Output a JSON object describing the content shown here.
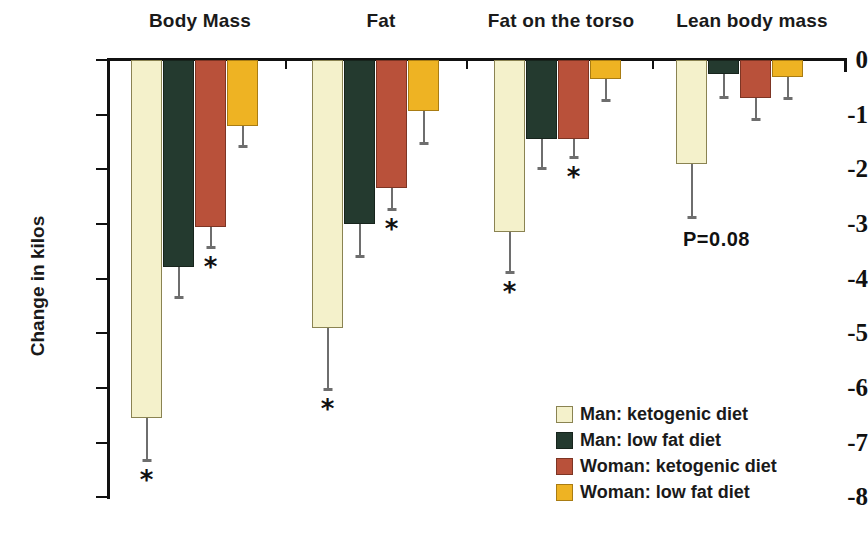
{
  "chart_data": {
    "type": "bar",
    "title": "",
    "xlabel": "",
    "ylabel": "Change in kilos",
    "ylim": [
      -8,
      0
    ],
    "grid": false,
    "legend_position": "bottom-right",
    "categories": [
      "Body Mass",
      "Fat",
      "Fat on the torso",
      "Lean body mass"
    ],
    "ytick_labels": [
      "0",
      "-1",
      "-2",
      "-3",
      "-4",
      "-5",
      "-6",
      "-7",
      "-8"
    ],
    "ytick_values": [
      0,
      -1,
      -2,
      -3,
      -4,
      -5,
      -6,
      -7,
      -8
    ],
    "series": [
      {
        "name": "Man: ketogenic diet",
        "color": "#f4f1cb",
        "values": [
          -6.55,
          -4.9,
          -3.15,
          -1.9
        ],
        "errors": [
          0.8,
          1.15,
          0.75,
          1.0
        ],
        "significance": [
          "*",
          "*",
          "*",
          ""
        ]
      },
      {
        "name": "Man: low fat diet",
        "color": "#243a2f",
        "values": [
          -3.8,
          -3.0,
          -1.45,
          -0.25
        ],
        "errors": [
          0.55,
          0.6,
          0.55,
          0.45
        ],
        "significance": [
          "",
          "",
          "",
          ""
        ]
      },
      {
        "name": "Woman: ketogenic diet",
        "color": "#b9513a",
        "values": [
          -3.05,
          -2.35,
          -1.45,
          -0.7
        ],
        "errors": [
          0.4,
          0.4,
          0.35,
          0.4
        ],
        "significance": [
          "*",
          "*",
          "*",
          ""
        ]
      },
      {
        "name": "Woman: low fat diet",
        "color": "#eeb323",
        "values": [
          -1.2,
          -0.93,
          -0.35,
          -0.32
        ],
        "errors": [
          0.4,
          0.6,
          0.4,
          0.4
        ],
        "significance": [
          "",
          "",
          "",
          ""
        ]
      }
    ],
    "annotations": [
      {
        "text": "P=0.08",
        "group": "Lean body mass",
        "series": "Man: ketogenic diet"
      }
    ]
  },
  "legend": {
    "items": [
      {
        "label": "Man: ketogenic diet",
        "swatch": "cream"
      },
      {
        "label": "Man: low fat diet",
        "swatch": "green"
      },
      {
        "label": "Woman: ketogenic diet",
        "swatch": "red"
      },
      {
        "label": "Woman: low fat diet",
        "swatch": "yellow"
      }
    ]
  },
  "axis": {
    "y_title": "Change in kilos"
  }
}
